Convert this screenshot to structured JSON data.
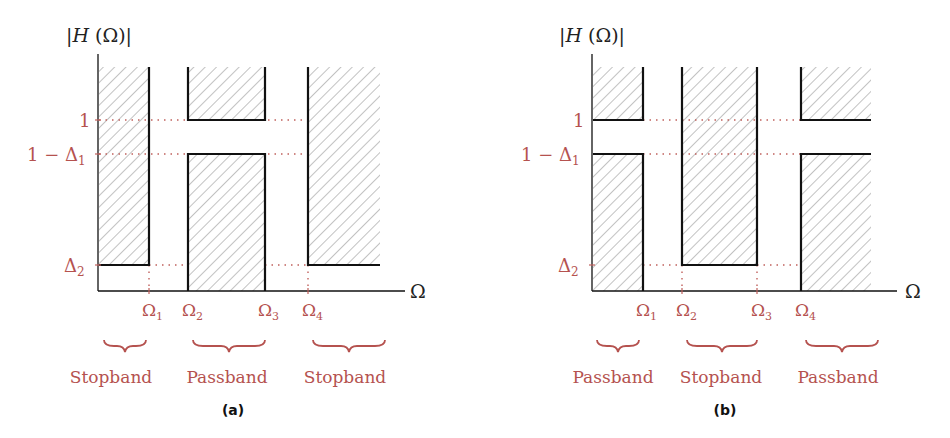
{
  "figure": {
    "colors": {
      "label": "#b5524f",
      "line": "#111111",
      "hatch": "#9a9a9a",
      "dotted": "#c0605c"
    },
    "panels": [
      {
        "id": "a",
        "caption": "(a)",
        "y_axis_label": "|H (Ω)|",
        "x_axis_label": "Ω",
        "y_ticks": [
          "1",
          "1 − Δ",
          "Δ"
        ],
        "y_tick_subscripts": [
          "",
          "1",
          "2"
        ],
        "x_ticks": [
          "Ω",
          "Ω",
          "Ω",
          "Ω"
        ],
        "x_tick_subscripts": [
          "1",
          "2",
          "3",
          "4"
        ],
        "bands": [
          "Stopband",
          "Passband",
          "Stopband"
        ],
        "filter_type": "bandpass"
      },
      {
        "id": "b",
        "caption": "(b)",
        "y_axis_label": "|H (Ω)|",
        "x_axis_label": "Ω",
        "y_ticks": [
          "1",
          "1 − Δ",
          "Δ"
        ],
        "y_tick_subscripts": [
          "",
          "1",
          "2"
        ],
        "x_ticks": [
          "Ω",
          "Ω",
          "Ω",
          "Ω"
        ],
        "x_tick_subscripts": [
          "1",
          "2",
          "3",
          "4"
        ],
        "bands": [
          "Passband",
          "Stopband",
          "Passband"
        ],
        "filter_type": "bandstop"
      }
    ]
  }
}
